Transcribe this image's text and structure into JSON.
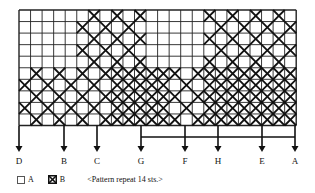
{
  "chart_data": {
    "type": "table",
    "grid": {
      "cols": 24,
      "rows": 10,
      "left": 19,
      "top": 10,
      "cell": 11.55
    },
    "regions": [
      {
        "rows": [
          0,
          4
        ],
        "cols": [
          5,
          10
        ],
        "pattern": "lattice"
      },
      {
        "rows": [
          0,
          4
        ],
        "cols": [
          16,
          23
        ],
        "pattern": "lattice"
      },
      {
        "rows": [
          5,
          9
        ],
        "cols": [
          0,
          23
        ],
        "pattern": "lattice"
      }
    ],
    "markers": [
      {
        "label": "D",
        "x": 19
      },
      {
        "label": "B",
        "x": 64
      },
      {
        "label": "C",
        "x": 97
      },
      {
        "label": "G",
        "x": 141
      },
      {
        "label": "F",
        "x": 185
      },
      {
        "label": "H",
        "x": 218
      },
      {
        "label": "E",
        "x": 262
      },
      {
        "label": "A",
        "x": 295
      }
    ],
    "bracket": {
      "from": "G",
      "to": "A"
    }
  },
  "legend": {
    "a_label": "A",
    "b_label": "B",
    "note": "<Pattern repeat 14 sts.>"
  }
}
